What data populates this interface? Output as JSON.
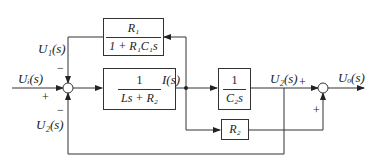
{
  "diagram": {
    "type": "block_diagram",
    "blocks": [
      {
        "id": "feedback_block",
        "numerator": "R₁",
        "denominator": "1 + R₁C₁s"
      },
      {
        "id": "inductor_block",
        "numerator": "1",
        "denominator": "Ls + R₂"
      },
      {
        "id": "capacitor_block",
        "numerator": "1",
        "denominator": "C₂s"
      },
      {
        "id": "resistor_block",
        "label": "R₂"
      }
    ],
    "signals": {
      "input": "Uᵢ(s)",
      "feedback_u1": "U₁(s)",
      "feedback_u2": "U₂(s)",
      "current": "I(s)",
      "u2_out": "U₂(s)",
      "output": "Uₒ(s)"
    },
    "signs": {
      "sum1_top": "−",
      "sum1_left": "+",
      "sum1_bottom": "−",
      "sum2_left": "+",
      "sum2_bottom": "+"
    }
  }
}
